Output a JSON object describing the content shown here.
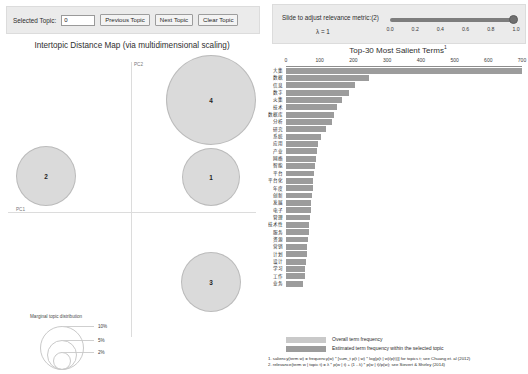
{
  "topic_controls": {
    "selected_topic_label": "Selected Topic:",
    "selected_topic_value": "0",
    "previous_button": "Previous Topic",
    "next_button": "Next Topic",
    "clear_button": "Clear Topic"
  },
  "relevance_controls": {
    "title": "Slide to adjust relevance metric:(2)",
    "lambda_label": "λ = 1",
    "lambda_value": 1.0,
    "ticks": [
      "0.0",
      "0.2",
      "0.4",
      "0.6",
      "0.8",
      "1.0"
    ]
  },
  "mds": {
    "title": "Intertopic Distance Map (via multidimensional scaling)",
    "x_axis_label": "PC1",
    "y_axis_label": "PC2",
    "legend_title": "Marginal topic distribution",
    "legend_sizes": [
      "2%",
      "5%",
      "10%"
    ],
    "topics": [
      {
        "id": "4",
        "x": 211,
        "y": 100,
        "r": 45
      },
      {
        "id": "2",
        "x": 46,
        "y": 176,
        "r": 30
      },
      {
        "id": "1",
        "x": 211,
        "y": 177,
        "r": 29
      },
      {
        "id": "3",
        "x": 211,
        "y": 282,
        "r": 30
      }
    ]
  },
  "chart_data": {
    "type": "bar",
    "title": "Top-30 Most Salient Terms",
    "title_superscript": "1",
    "orientation": "horizontal",
    "xlabel": "",
    "ylabel": "",
    "xlim": [
      0,
      700
    ],
    "xticks": [
      0,
      100,
      200,
      300,
      400,
      500,
      600,
      700
    ],
    "grid": false,
    "legend_position": "bottom",
    "colors": {
      "overall": "#c9c9c9",
      "selected": "#9c9c9c"
    },
    "series": [
      {
        "name": "Overall term frequency",
        "key": "overall"
      },
      {
        "name": "Estimated term frequency within the selected topic",
        "key": "selected"
      }
    ],
    "categories": [
      "大集",
      "数据",
      "信息",
      "数字",
      "火集",
      "技术",
      "数据库",
      "分析",
      "研究",
      "系统",
      "应用",
      "产业",
      "网络",
      "智能",
      "平台",
      "平台化",
      "年度",
      "创新",
      "发展",
      "电子",
      "管理",
      "技术性",
      "服务",
      "资源",
      "营销",
      "计划",
      "设计",
      "学习",
      "工作",
      "业务"
    ],
    "values": [
      700,
      245,
      205,
      186,
      165,
      152,
      143,
      136,
      118,
      104,
      96,
      92,
      88,
      85,
      83,
      81,
      79,
      77,
      75,
      73,
      71,
      69,
      67,
      65,
      63,
      61,
      59,
      57,
      55,
      50
    ]
  },
  "footnotes": [
    "1. saliency(term w) = frequency(w) * [sum_t p(t | w) * log(p(t | w)/p(t))] for topics t; see Chuang et. al (2012)",
    "2. relevance(term w | topic t) = λ * p(w | t) + (1 - λ) * p(w | t)/p(w); see Sievert & Shirley (2014)"
  ]
}
